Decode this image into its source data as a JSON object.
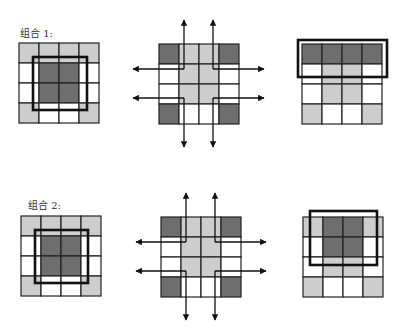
{
  "colors": {
    "dark": "#6e6e6e",
    "light": "#cdcdcd",
    "white": "#ffffff",
    "line": "#222222",
    "frame": "#111111"
  },
  "groups": [
    {
      "label": "组合 1:",
      "label_pos": [
        20,
        26
      ],
      "panels": [
        {
          "name": "left-grid",
          "origin": [
            19,
            43
          ],
          "cell": 20,
          "cells": [
            [
              "light",
              "light",
              "light",
              "light"
            ],
            [
              "white",
              "dark",
              "dark",
              "white"
            ],
            [
              "white",
              "dark",
              "dark",
              "white"
            ],
            [
              "light",
              "white",
              "white",
              "light"
            ]
          ],
          "frame": [
            33,
            57,
            54,
            53
          ]
        },
        {
          "name": "center-grid",
          "origin": [
            159,
            44
          ],
          "cell": 20,
          "cells": [
            [
              "dark",
              "light",
              "light",
              "dark"
            ],
            [
              "white",
              "light",
              "light",
              "white"
            ],
            [
              "white",
              "light",
              "light",
              "white"
            ],
            [
              "dark",
              "white",
              "white",
              "dark"
            ]
          ],
          "arrows": {
            "v_x": [
              184,
              213
            ],
            "h_y": [
              69,
              98
            ],
            "top": 20,
            "bottom": 147,
            "left": 133,
            "right": 264
          }
        },
        {
          "name": "right-grid",
          "origin": [
            302,
            44
          ],
          "cell": 20,
          "cells": [
            [
              "dark",
              "dark",
              "dark",
              "dark"
            ],
            [
              "white",
              "light",
              "light",
              "white"
            ],
            [
              "white",
              "light",
              "light",
              "white"
            ],
            [
              "light",
              "white",
              "white",
              "light"
            ]
          ],
          "frame": [
            298,
            40,
            89,
            37
          ]
        }
      ]
    },
    {
      "label": "组合 2:",
      "label_pos": [
        28,
        198
      ],
      "panels": [
        {
          "name": "left-grid",
          "origin": [
            21,
            216
          ],
          "cell": 20,
          "cells": [
            [
              "light",
              "light",
              "light",
              "light"
            ],
            [
              "white",
              "dark",
              "dark",
              "white"
            ],
            [
              "white",
              "dark",
              "dark",
              "white"
            ],
            [
              "light",
              "white",
              "white",
              "light"
            ]
          ],
          "frame": [
            35,
            230,
            53,
            53
          ]
        },
        {
          "name": "center-grid",
          "origin": [
            161,
            217
          ],
          "cell": 20,
          "cells": [
            [
              "dark",
              "light",
              "light",
              "dark"
            ],
            [
              "white",
              "light",
              "light",
              "white"
            ],
            [
              "white",
              "light",
              "light",
              "white"
            ],
            [
              "dark",
              "white",
              "white",
              "dark"
            ]
          ],
          "arrows": {
            "v_x": [
              186,
              215
            ],
            "h_y": [
              242,
              271
            ],
            "top": 193,
            "bottom": 320,
            "left": 136,
            "right": 266
          }
        },
        {
          "name": "right-grid",
          "origin": [
            303,
            217
          ],
          "cell": 20,
          "cells": [
            [
              "light",
              "dark",
              "dark",
              "light"
            ],
            [
              "white",
              "dark",
              "dark",
              "white"
            ],
            [
              "white",
              "light",
              "light",
              "white"
            ],
            [
              "light",
              "white",
              "white",
              "light"
            ]
          ],
          "frame": [
            310,
            211,
            67,
            54
          ]
        }
      ]
    }
  ]
}
